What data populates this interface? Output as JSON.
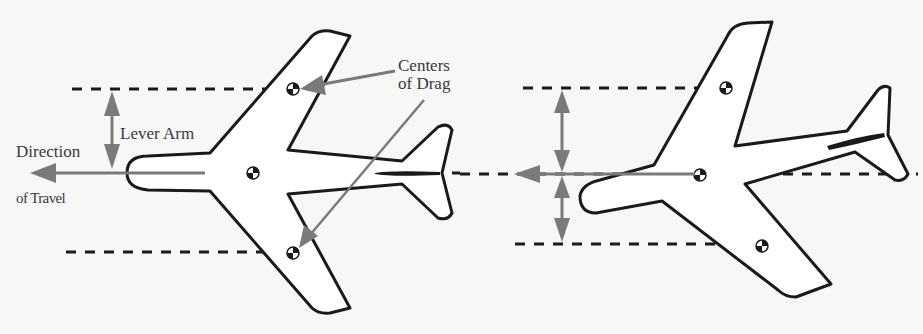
{
  "figure": {
    "left": {
      "labels": {
        "lever_arm": "Lever Arm",
        "direction_line1": "Direction",
        "direction_line2": "of Travel",
        "centers_line1": "Centers",
        "centers_line2": "of Drag"
      }
    },
    "right": {},
    "colors": {
      "background": "#f7f7f6",
      "outline": "#1a1a1a",
      "arrow": "#7a7a7a",
      "text": "#3a3a3a"
    }
  }
}
